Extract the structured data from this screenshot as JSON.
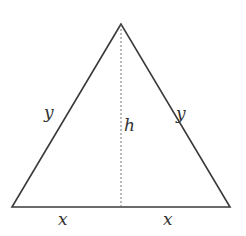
{
  "diagram": {
    "type": "isosceles-triangle",
    "stroke_color": "#3a3a3a",
    "altitude_color": "#777777",
    "vertices": {
      "apex": [
        121,
        24
      ],
      "bottom_left": [
        12,
        207
      ],
      "bottom_right": [
        230,
        207
      ],
      "altitude_foot": [
        121,
        207
      ]
    },
    "labels": {
      "left_side": "y",
      "right_side": "y",
      "height": "h",
      "base_left": "x",
      "base_right": "x"
    }
  }
}
